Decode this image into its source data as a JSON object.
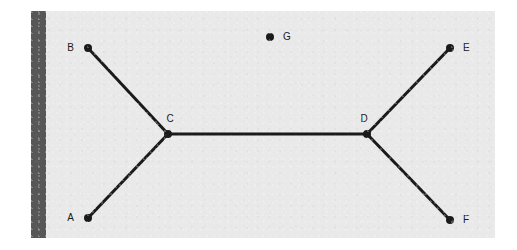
{
  "figure": {
    "title": "",
    "background_color": "#e9e9e9",
    "page_color": "#ffffff",
    "sidebar_color": "#575757",
    "ink_color": "#1a1a1a",
    "frame": {
      "x": 31,
      "y": 11,
      "width": 464,
      "height": 227
    },
    "sidebar": {
      "x": 0,
      "y": 0,
      "width": 15,
      "height": 227
    }
  },
  "chart_data": {
    "type": "scatter",
    "title": "",
    "xlabel": "",
    "ylabel": "",
    "grid": false,
    "legend": "none",
    "xlim": [
      0,
      464
    ],
    "ylim": [
      0,
      227
    ],
    "node_radius": 4,
    "edge_width": 3,
    "nodes": [
      {
        "id": "A",
        "label": "A",
        "x": 57,
        "y": 207,
        "label_x": 43,
        "label_y": 207,
        "label_side": "left",
        "connected": true
      },
      {
        "id": "B",
        "label": "B",
        "x": 57,
        "y": 37,
        "label_x": 43,
        "label_y": 37,
        "label_side": "left",
        "connected": true
      },
      {
        "id": "C",
        "label": "C",
        "x": 137,
        "y": 123,
        "label_x": 139,
        "label_y": 108,
        "label_side": "above",
        "connected": true
      },
      {
        "id": "D",
        "label": "D",
        "x": 336,
        "y": 123,
        "label_x": 333,
        "label_y": 108,
        "label_side": "above",
        "connected": true
      },
      {
        "id": "E",
        "label": "E",
        "x": 419,
        "y": 37,
        "label_x": 432,
        "label_y": 37,
        "label_side": "right",
        "connected": true
      },
      {
        "id": "F",
        "label": "F",
        "x": 419,
        "y": 209,
        "label_x": 432,
        "label_y": 209,
        "label_side": "right",
        "connected": true
      },
      {
        "id": "G",
        "label": "G",
        "x": 239,
        "y": 26,
        "label_x": 252,
        "label_y": 26,
        "label_side": "right",
        "connected": false
      }
    ],
    "edges": [
      {
        "id": "B-C",
        "source": "B",
        "target": "C"
      },
      {
        "id": "A-C",
        "source": "A",
        "target": "C"
      },
      {
        "id": "C-D",
        "source": "C",
        "target": "D"
      },
      {
        "id": "D-E",
        "source": "D",
        "target": "E"
      },
      {
        "id": "D-F",
        "source": "D",
        "target": "F"
      }
    ],
    "isolated_nodes": [
      "G"
    ],
    "node_count": 7,
    "edge_count": 5
  }
}
